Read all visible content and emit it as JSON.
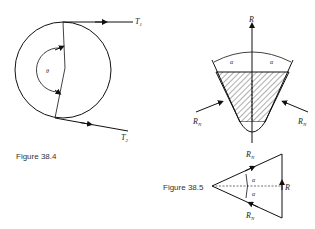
{
  "figure_38_4": {
    "caption": "Figure 38.4",
    "labels": {
      "tension_tight": "T",
      "tension_tight_sub": "1",
      "tension_slack": "T",
      "tension_slack_sub": "2",
      "wrap_angle": "θ"
    }
  },
  "figure_38_5": {
    "caption": "Figure 38.5",
    "cross_section": {
      "resultant": "R",
      "normal_left": "R",
      "normal_left_sub": "N",
      "normal_right": "R",
      "normal_right_sub": "N",
      "half_angle_left": "α",
      "half_angle_right": "α"
    },
    "force_triangle": {
      "top": "R",
      "top_sub": "N",
      "bottom": "R",
      "bottom_sub": "N",
      "resultant": "R",
      "angle_upper": "α",
      "angle_lower": "α"
    }
  }
}
